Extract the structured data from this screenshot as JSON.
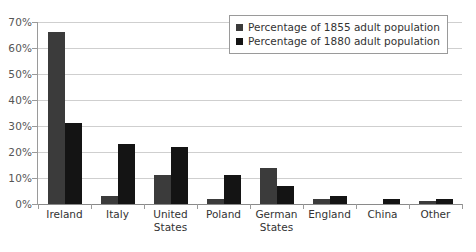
{
  "chart_data": {
    "type": "bar",
    "title": "",
    "subtitle": "",
    "xlabel": "",
    "ylabel": "",
    "ylim": [
      0,
      70
    ],
    "ytick_labels": [
      "0%",
      "10%",
      "20%",
      "30%",
      "40%",
      "50%",
      "60%",
      "70%"
    ],
    "ytick_values": [
      0,
      10,
      20,
      30,
      40,
      50,
      60,
      70
    ],
    "grid": true,
    "legend_position": "top-right",
    "categories": [
      "Ireland",
      "Italy",
      "United\nStates",
      "Poland",
      "German\nStates",
      "England",
      "China",
      "Other"
    ],
    "series": [
      {
        "name": "Percentage of 1855 adult population",
        "color": "#3b3b3b",
        "values": [
          66,
          3,
          11,
          2,
          14,
          2,
          0,
          1
        ]
      },
      {
        "name": "Percentage of 1880 adult population",
        "color": "#141414",
        "values": [
          31,
          23,
          22,
          11,
          7,
          3,
          2,
          2
        ]
      }
    ]
  },
  "legend": {
    "entries": [
      {
        "label": "Percentage of 1855 adult population",
        "color": "#3b3b3b"
      },
      {
        "label": "Percentage of 1880 adult population",
        "color": "#141414"
      }
    ]
  },
  "colors": {
    "series_1855": "#3b3b3b",
    "series_1880": "#141414",
    "gridline": "#cfcfcf",
    "axis": "#9a9a9a",
    "background": "#ffffff",
    "text": "#333333"
  }
}
